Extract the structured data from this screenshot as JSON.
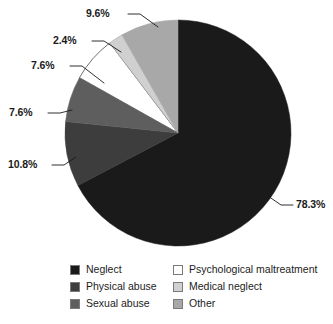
{
  "chart_data": {
    "type": "pie",
    "title": "",
    "subtitle": "",
    "xlabel": "",
    "ylabel": "",
    "legend_position": "bottom",
    "grid": false,
    "categories": [
      "Neglect",
      "Physical abuse",
      "Sexual abuse",
      "Psychological maltreatment",
      "Medical neglect",
      "Other"
    ],
    "values": [
      78.3,
      10.8,
      7.6,
      7.6,
      2.4,
      9.6
    ],
    "value_labels": [
      "78.3%",
      "10.8%",
      "7.6%",
      "7.6%",
      "2.4%",
      "9.6%"
    ],
    "colors": [
      "#1a1a1a",
      "#3d3d3d",
      "#5e5e5e",
      "#ffffff",
      "#d0d0d0",
      "#a8a8a8"
    ],
    "slices": [
      {
        "name": "Neglect",
        "value": 78.3,
        "label": "78.3%",
        "color": "#1a1a1a",
        "start_angle": 0,
        "sweep": 281.88
      },
      {
        "name": "Physical abuse",
        "value": 10.8,
        "label": "10.8%",
        "color": "#3d3d3d",
        "start_angle": 281.88,
        "sweep": 38.88
      },
      {
        "name": "Sexual abuse",
        "value": 7.6,
        "label": "7.6%",
        "color": "#5e5e5e",
        "start_angle": 320.76,
        "sweep": 27.36
      },
      {
        "name": "Psychological maltreatment",
        "value": 7.6,
        "label": "7.6%",
        "color": "#ffffff",
        "start_angle": 348.12,
        "sweep": 27.36
      },
      {
        "name": "Medical neglect",
        "value": 2.4,
        "label": "2.4%",
        "color": "#d0d0d0",
        "start_angle": 375.48,
        "sweep": 8.64
      },
      {
        "name": "Other",
        "value": 9.6,
        "label": "9.6%",
        "color": "#a8a8a8",
        "start_angle": 384.12,
        "sweep": 34.56
      }
    ]
  },
  "labels": {
    "neglect": "78.3%",
    "physical_abuse": "10.8%",
    "sexual_abuse": "7.6%",
    "psychological_maltreatment": "7.6%",
    "medical_neglect": "2.4%",
    "other": "9.6%"
  },
  "legend": {
    "left_column": [
      {
        "label": "Neglect",
        "color": "#1a1a1a"
      },
      {
        "label": "Physical abuse",
        "color": "#3d3d3d"
      },
      {
        "label": "Sexual abuse",
        "color": "#5e5e5e"
      }
    ],
    "right_column": [
      {
        "label": "Psychological maltreatment",
        "color": "#ffffff"
      },
      {
        "label": "Medical neglect",
        "color": "#d0d0d0"
      },
      {
        "label": "Other",
        "color": "#a8a8a8"
      }
    ]
  }
}
